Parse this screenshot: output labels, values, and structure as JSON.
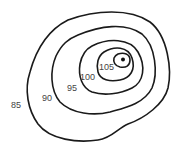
{
  "diagram": {
    "type": "contour-map",
    "line_color": "#1a1a1a",
    "label_color": "#444444",
    "summit_marker": "filled-dot",
    "contours": [
      {
        "value": "85",
        "label": "85"
      },
      {
        "value": "90",
        "label": "90"
      },
      {
        "value": "95",
        "label": "95"
      },
      {
        "value": "100",
        "label": "100"
      },
      {
        "value": "105",
        "label": "105"
      }
    ]
  }
}
